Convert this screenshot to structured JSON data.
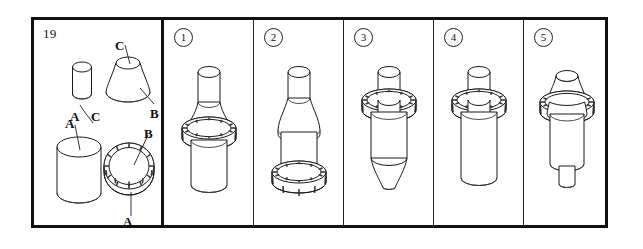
{
  "question": {
    "number": "19",
    "type": "3d-assembly-spatial-reasoning"
  },
  "parts_panel": {
    "labels": [
      {
        "id": "c-top",
        "text": "C"
      },
      {
        "id": "c-small-cylinder",
        "text": "C"
      },
      {
        "id": "a-small-left",
        "text": "A"
      },
      {
        "id": "b-cone",
        "text": "B"
      },
      {
        "id": "a-large-cylinder",
        "text": "A"
      },
      {
        "id": "b-ring",
        "text": "B"
      },
      {
        "id": "a-ring-base",
        "text": "A"
      }
    ],
    "components": [
      {
        "name": "small-cylinder",
        "label": "C"
      },
      {
        "name": "cone-frustum",
        "label": "B"
      },
      {
        "name": "large-cylinder",
        "label": "A"
      },
      {
        "name": "knurled-ring",
        "label": "B"
      }
    ]
  },
  "options": [
    {
      "number": "1",
      "shape": "small-cylinder-top, inverted-cone, knurled-ring, large-cylinder-bottom"
    },
    {
      "number": "2",
      "shape": "small-cylinder-top, tapered-cone, cylinder, knurled-ring-base"
    },
    {
      "number": "3",
      "shape": "small-cylinder-top, knurled-ring, cylinder, cone-point-down"
    },
    {
      "number": "4",
      "shape": "small-cylinder-top, knurled-ring, large-cylinder-bottom"
    },
    {
      "number": "5",
      "shape": "cone-top, knurled-ring, large-cylinder, small-cylinder-bottom"
    }
  ],
  "colors": {
    "frame": "#111111",
    "divider": "#222222",
    "line": "#1a1a1a",
    "background": "#ffffff"
  }
}
